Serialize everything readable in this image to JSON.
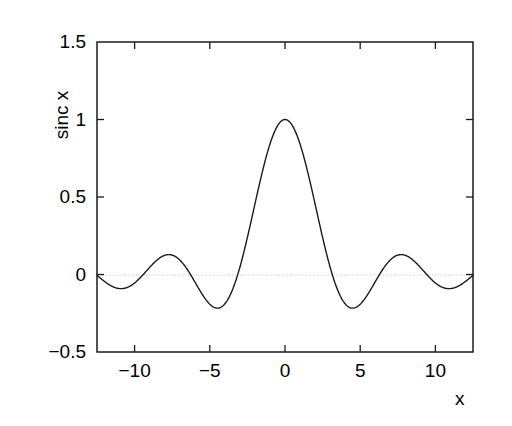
{
  "figure": {
    "background_color": "#ffffff",
    "frame_color": "#1a1a1a",
    "curve_color": "#1a1a1a",
    "zero_line_color": "#bfbfbf"
  },
  "chart_data": {
    "type": "line",
    "title": "",
    "subtitle": "",
    "xlabel": "x",
    "ylabel": "sinc x",
    "xlim": [
      -12.5,
      12.5
    ],
    "ylim": [
      -0.5,
      1.5
    ],
    "xticks": [
      -10,
      -5,
      0,
      5,
      10
    ],
    "xticklabels": [
      "−10",
      "−5",
      "0",
      "5",
      "10"
    ],
    "yticks": [
      -0.5,
      0,
      0.5,
      1,
      1.5
    ],
    "yticklabels": [
      "−0.5",
      "0",
      "0.5",
      "1",
      "1.5"
    ],
    "grid": false,
    "legend": null,
    "legend_position": "none",
    "annotations": [],
    "reference_lines": [
      {
        "orientation": "horizontal",
        "value": 0,
        "style": "dotted",
        "color": "#bfbfbf"
      }
    ],
    "series": [
      {
        "name": "sinc x",
        "formula": "sin(x)/x",
        "color": "#1a1a1a",
        "linewidth": 1.4,
        "x": [
          -12.5,
          -12.25,
          -12,
          -11.75,
          -11.5,
          -11.25,
          -11,
          -10.75,
          -10.5,
          -10.25,
          -10,
          -9.75,
          -9.5,
          -9.25,
          -9,
          -8.75,
          -8.5,
          -8.25,
          -8,
          -7.75,
          -7.5,
          -7.25,
          -7,
          -6.75,
          -6.5,
          -6.25,
          -6,
          -5.75,
          -5.5,
          -5.25,
          -5,
          -4.75,
          -4.5,
          -4.25,
          -4,
          -3.75,
          -3.5,
          -3.25,
          -3,
          -2.75,
          -2.5,
          -2.25,
          -2,
          -1.75,
          -1.5,
          -1.25,
          -1,
          -0.75,
          -0.5,
          -0.25,
          0,
          0.25,
          0.5,
          0.75,
          1,
          1.25,
          1.5,
          1.75,
          2,
          2.25,
          2.5,
          2.75,
          3,
          3.25,
          3.5,
          3.75,
          4,
          4.25,
          4.5,
          4.75,
          5,
          5.25,
          5.5,
          5.75,
          6,
          6.25,
          6.5,
          6.75,
          7,
          7.25,
          7.5,
          7.75,
          8,
          8.25,
          8.5,
          8.75,
          9,
          9.25,
          9.5,
          9.75,
          10,
          10.25,
          10.5,
          10.75,
          11,
          11.25,
          11.5,
          11.75,
          12,
          12.25,
          12.5
        ],
        "y": [
          -0.0053,
          -0.0354,
          -0.0447,
          -0.0329,
          -0.0073,
          0.0215,
          0.0091,
          0.0723,
          0.0845,
          0.0782,
          0.0544,
          0.0199,
          -0.0164,
          -0.0452,
          -0.0458,
          -0.0736,
          -0.0895,
          -0.0918,
          -0.081,
          -0.0595,
          -0.0251,
          0.0118,
          0.0939,
          0.0629,
          0.0331,
          0.0999,
          0.0466,
          -0.0922,
          0.1281,
          0.16,
          0.1918,
          0.2085,
          -0.2172,
          -0.1879,
          -0.1892,
          -0.1527,
          -0.1002,
          -0.0336,
          0.047,
          0.1405,
          0.2394,
          0.3458,
          0.4546,
          0.562,
          0.665,
          0.7589,
          0.8415,
          0.9089,
          0.9589,
          0.9896,
          1.0,
          0.9896,
          0.9589,
          0.9089,
          0.8415,
          0.7589,
          0.665,
          0.562,
          0.4546,
          0.3458,
          0.2394,
          0.1405,
          0.047,
          -0.0336,
          -0.1002,
          -0.1527,
          -0.1892,
          -0.2085,
          -0.2172,
          -0.2085,
          -0.1918,
          -0.16,
          -0.1281,
          -0.0922,
          -0.0466,
          0.0,
          0.0331,
          0.0629,
          0.0939,
          0.1083,
          0.1251,
          0.1283,
          0.1237,
          0.1118,
          0.0939,
          0.0716,
          0.0458,
          0.0164,
          -0.0199,
          -0.0544,
          -0.0544,
          -0.0782,
          -0.0845,
          -0.0723,
          -0.0091,
          -0.0215,
          0.0073,
          0.0329,
          0.0447,
          0.0354,
          0.0053
        ],
        "key_points": {
          "main_peak": {
            "x": 0,
            "y": 1.0
          },
          "first_minima": [
            {
              "x": -4.493,
              "y": -0.2172
            },
            {
              "x": 4.493,
              "y": -0.2172
            }
          ],
          "side_maxima": [
            {
              "x": -7.725,
              "y": 0.1284
            },
            {
              "x": 7.725,
              "y": 0.1284
            }
          ],
          "second_minima": [
            {
              "x": -10.904,
              "y": -0.0913
            },
            {
              "x": 10.904,
              "y": -0.0913
            }
          ],
          "zero_crossings": [
            -9.4248,
            -6.2832,
            -3.1416,
            3.1416,
            6.2832,
            9.4248,
            -12.5664,
            12.5664
          ]
        }
      }
    ]
  }
}
